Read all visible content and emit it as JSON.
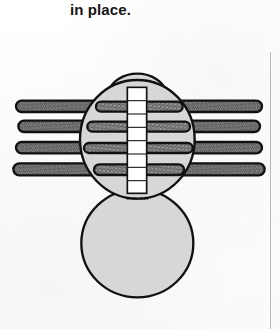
{
  "page": {
    "caption": "in place.",
    "background_color": "#fdfdfd",
    "right_rule_color": "#b9b9b9"
  },
  "figure": {
    "name": "spider-underside-diagram",
    "colors": {
      "outline": "#111111",
      "body_fill": "#d7d7d7",
      "leg_fill": "#8c8c8c",
      "leg_inner_fill": "#9a9a9a",
      "ladder_fill": "#ffffff",
      "hatch": "#2a2a2a"
    },
    "parts": {
      "head": {
        "label": "head-dome",
        "cx": 200,
        "cy": 75,
        "rx": 85,
        "ry": 52
      },
      "thorax": {
        "label": "thorax-oval",
        "cx": 200,
        "cy": 135,
        "rx": 170,
        "ry": 170
      },
      "abdomen": {
        "label": "abdomen-circle",
        "cx": 200,
        "cy": 290,
        "rx": 168,
        "ry": 160
      },
      "ladder": {
        "label": "center-ladder-strip",
        "rungs": 8
      },
      "legs": {
        "label": "leg-pairs",
        "pairs": 4,
        "sides": [
          "left",
          "right"
        ]
      }
    },
    "annotation": {
      "underside_label": "Underside"
    }
  }
}
